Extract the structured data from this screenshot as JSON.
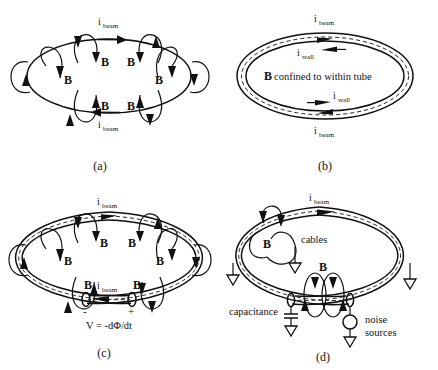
{
  "figure": {
    "background_color": "#ffffff",
    "ink_color": "#111111"
  },
  "labels": {
    "i_symbol": "i",
    "beam_sub": "beam",
    "wall_sub": "wall",
    "b_field": "B",
    "b_confined_text": "confined to within tube",
    "voltage_equation": "V = -dΦ/dt",
    "plus_sign": "+",
    "minus_sign": "-",
    "cables": "cables",
    "capacitance": "capacitance",
    "noise": "noise",
    "sources": "sources"
  },
  "panels": [
    {
      "id": "a",
      "caption": "(a)",
      "description": "Bare beam loop with encircling B-field lines",
      "beam_labels": [
        "i_beam",
        "i_beam"
      ],
      "b_labels_count": 8,
      "has_tube": false,
      "has_gap": false
    },
    {
      "id": "b",
      "caption": "(b)",
      "description": "Beam inside conducting tube, B confined within tube",
      "beam_labels": [
        "i_beam",
        "i_beam"
      ],
      "wall_labels": [
        "i_wall",
        "i_wall"
      ],
      "center_text_bold": "B",
      "center_text_rest": "confined to within tube",
      "has_tube": true,
      "has_gap": false
    },
    {
      "id": "c",
      "caption": "(c)",
      "description": "Tube with a break: B escapes, voltage appears across gap",
      "beam_labels": [
        "i_beam",
        "i_beam"
      ],
      "b_labels_count": 8,
      "has_tube": true,
      "has_gap": true,
      "gap_polarity": [
        "-",
        "+"
      ],
      "gap_equation": "V = -dΦ/dt"
    },
    {
      "id": "d",
      "caption": "(d)",
      "description": "Tube with cables, capacitance and noise sources grounded",
      "beam_labels": [
        "i_beam"
      ],
      "b_labels_count": 2,
      "annotations": [
        "cables",
        "capacitance",
        "noise sources"
      ],
      "ground_symbols": 5,
      "has_tube": true,
      "has_gap": true
    }
  ],
  "captions": {
    "a": "(a)",
    "b": "(b)",
    "c": "(c)",
    "d": "(d)"
  }
}
